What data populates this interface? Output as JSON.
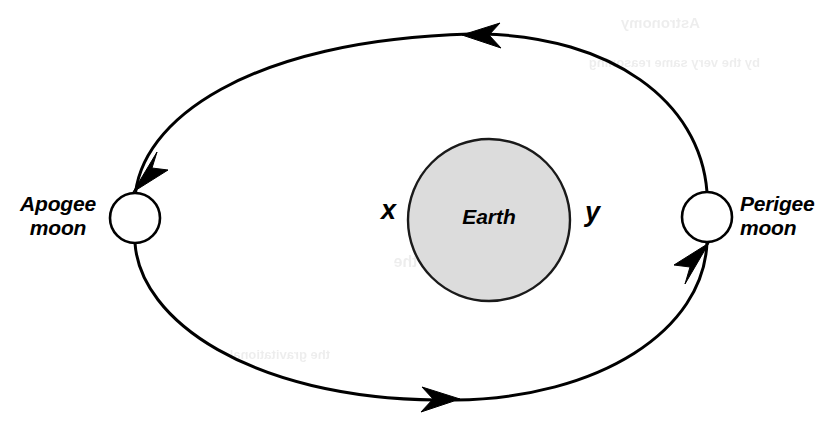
{
  "figure": {
    "type": "orbit-diagram",
    "background_color": "#ffffff",
    "stroke_color": "#000000",
    "earth_fill_color": "#dcdcdc",
    "moon_fill_color": "#ffffff"
  },
  "labels": {
    "apogee_line1": "Apogee",
    "apogee_line2": "moon",
    "perigee_line1": "Perigee",
    "perigee_line2": "moon",
    "earth": "Earth",
    "x": "x",
    "y": "y"
  },
  "geometry": {
    "orbit": {
      "shape": "ellipse",
      "center_x": 421,
      "center_y": 217,
      "radius_x": 286,
      "radius_y": 184,
      "stroke_width": 3
    },
    "earth": {
      "shape": "circle",
      "center_x": 489,
      "center_y": 220,
      "radius": 81,
      "stroke_width": 2.4
    },
    "apogee_moon": {
      "shape": "circle",
      "center_x": 135,
      "center_y": 218,
      "radius": 25,
      "stroke_width": 2.6
    },
    "perigee_moon": {
      "shape": "circle",
      "center_x": 707,
      "center_y": 217,
      "radius": 25,
      "stroke_width": 2.6
    }
  },
  "arrows": [
    {
      "name": "top-arrow",
      "direction": "left",
      "x": 478,
      "y": 35
    },
    {
      "name": "bottom-arrow",
      "direction": "right",
      "x": 443,
      "y": 399
    },
    {
      "name": "apogee-approach-arrow",
      "direction": "down-left",
      "x": 140,
      "y": 188
    },
    {
      "name": "perigee-approach-arrow",
      "direction": "up-right",
      "x": 701,
      "y": 248
    }
  ],
  "orbit_direction": "counterclockwise",
  "ghost_text": [
    {
      "text": "Astronomy",
      "x": 700,
      "y": 14,
      "size": 15
    },
    {
      "text": "by the very same reasoning",
      "x": 760,
      "y": 55,
      "size": 13
    },
    {
      "text": "the Moon swings",
      "x": 540,
      "y": 165,
      "size": 15
    },
    {
      "text": "pull of the",
      "x": 470,
      "y": 253,
      "size": 16
    },
    {
      "text": "the gravitational",
      "x": 330,
      "y": 347,
      "size": 13
    }
  ]
}
